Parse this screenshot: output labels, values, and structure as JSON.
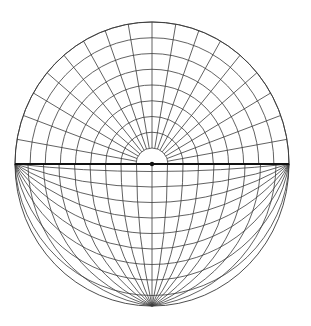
{
  "diagram": {
    "type": "hemispherical projection net",
    "colors": {
      "background": "#ffffff",
      "grid_line": "#3a3a3a",
      "diameter_line": "#111111"
    },
    "geometry": {
      "center": [
        152,
        164
      ],
      "radius_x": 137,
      "radius_y": 142,
      "bottom_pole": [
        152,
        306
      ]
    },
    "upper_half": {
      "polar_rings": 9,
      "inner_ring_radius": 16,
      "angular_divisions": 18,
      "angle_step_deg": 10
    },
    "lower_half": {
      "endpoint_arcs": 9,
      "pole_arcs_per_side": 8,
      "spacing_px": 15.5
    },
    "center_marker": "dot"
  }
}
